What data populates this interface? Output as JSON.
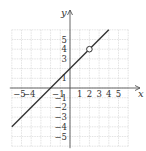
{
  "chart_data": {
    "type": "line",
    "title": "",
    "xlabel": "x",
    "ylabel": "y",
    "xlim": [
      -6,
      6
    ],
    "ylim": [
      -6,
      6
    ],
    "grid": true,
    "x_ticks": [
      "-5",
      "-4",
      "-1",
      "1",
      "2",
      "3",
      "4",
      "5"
    ],
    "y_ticks": [
      "5",
      "4",
      "3",
      "1",
      "-1",
      "-2",
      "-3",
      "-4",
      "-5"
    ],
    "series": [
      {
        "name": "y = x + 2",
        "equation": "y = x + 2",
        "x": [
          -6,
          4
        ],
        "y": [
          -4,
          6
        ],
        "open_points": [
          [
            2,
            4
          ]
        ]
      }
    ]
  },
  "colors": {
    "grid": "#d0d0d0",
    "axis": "#555555",
    "line": "#333333"
  }
}
